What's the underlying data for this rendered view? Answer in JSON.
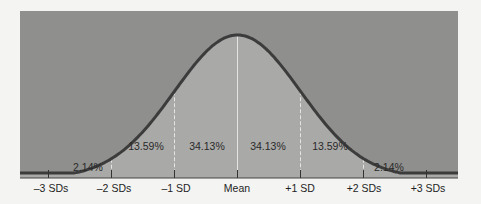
{
  "chart_data": {
    "type": "area",
    "title": "",
    "xlabel": "",
    "ylabel": "",
    "categories": [
      "-3 SDs",
      "-2 SDs",
      "-1 SD",
      "Mean",
      "+1 SD",
      "+2 SDs",
      "+3 SDs"
    ],
    "tick_labels": [
      "–3 SDs",
      "–2 SDs",
      "–1 SD",
      "Mean",
      "+1 SD",
      "+2 SDs",
      "+3 SDs"
    ],
    "segments": [
      {
        "from": "-3 SDs",
        "to": "-2 SDs",
        "label": "2.14%",
        "value": 2.14
      },
      {
        "from": "-2 SDs",
        "to": "-1 SD",
        "label": "13.59%",
        "value": 13.59
      },
      {
        "from": "-1 SD",
        "to": "Mean",
        "label": "34.13%",
        "value": 34.13
      },
      {
        "from": "Mean",
        "to": "+1 SD",
        "label": "34.13%",
        "value": 34.13
      },
      {
        "from": "+1 SD",
        "to": "+2 SDs",
        "label": "13.59%",
        "value": 13.59
      },
      {
        "from": "+2 SDs",
        "to": "+3 SDs",
        "label": "2.14%",
        "value": 2.14
      }
    ],
    "grid": false,
    "legend": null,
    "colors": {
      "background": "#8f8f8d",
      "under_curve": "#a9a9a7",
      "curve": "#3c3c3c",
      "page": "#f4f4f2"
    }
  }
}
